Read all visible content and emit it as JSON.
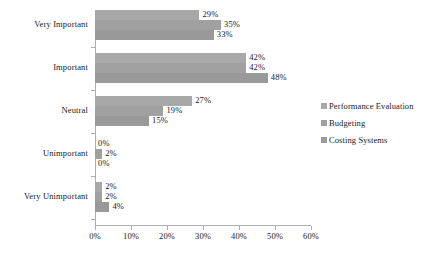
{
  "chart_data": {
    "type": "bar",
    "orientation": "horizontal",
    "title": "",
    "subtitle": "",
    "xlabel": "",
    "ylabel": "",
    "xlim": [
      0,
      60
    ],
    "xtick_labels": [
      "0%",
      "10%",
      "20%",
      "30%",
      "40%",
      "50%",
      "60%"
    ],
    "xtick_values": [
      0,
      10,
      20,
      30,
      40,
      50,
      60
    ],
    "grid": false,
    "legend_position": "right",
    "categories": [
      "Very Important",
      "Important",
      "Neutral",
      "Unimportant",
      "Very Unimportant"
    ],
    "series": [
      {
        "name": "Performance Evaluation",
        "color": "#a8a8a8",
        "values": [
          29,
          42,
          27,
          0,
          2
        ],
        "labels": [
          "29%",
          "42%",
          "27%",
          "0%",
          "2%"
        ]
      },
      {
        "name": "Budgeting",
        "color": "#a0a0a0",
        "values": [
          35,
          42,
          19,
          2,
          2
        ],
        "labels": [
          "35%",
          "42%",
          "19%",
          "2%",
          "2%"
        ]
      },
      {
        "name": "Costing Systems",
        "color": "#999999",
        "values": [
          33,
          48,
          15,
          0,
          4
        ],
        "labels": [
          "33%",
          "48%",
          "15%",
          "0%",
          "4%"
        ]
      }
    ]
  },
  "legend": {
    "items": [
      {
        "label": "Performance Evaluation",
        "color": "#a8a8a8"
      },
      {
        "label": "Budgeting",
        "color": "#a0a0a0"
      },
      {
        "label": "Costing Systems",
        "color": "#999999"
      }
    ]
  },
  "axis": {
    "x_tick_labels": [
      "0%",
      "10%",
      "20%",
      "30%",
      "40%",
      "50%",
      "60%"
    ],
    "category_labels": [
      "Very Important",
      "Important",
      "Neutral",
      "Unimportant",
      "Very Unimportant"
    ],
    "axis_color": "#adadad"
  }
}
